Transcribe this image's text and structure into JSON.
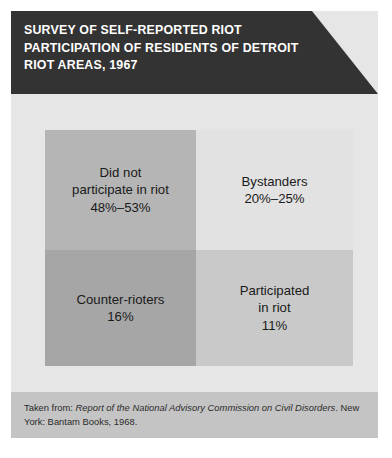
{
  "header": {
    "title_lines": [
      "SURVEY OF SELF-REPORTED RIOT",
      "PARTICIPATION OF RESIDENTS OF DETROIT",
      "RIOT AREAS, 1967"
    ],
    "background_color": "#333333",
    "text_color": "#ffffff"
  },
  "chart_data": {
    "type": "table",
    "title": "SURVEY OF SELF-REPORTED RIOT PARTICIPATION OF RESIDENTS OF DETROIT RIOT AREAS, 1967",
    "categories": [
      "Did not participate in riot",
      "Bystanders",
      "Counter-rioters",
      "Participated in riot"
    ],
    "values": [
      50.5,
      22.5,
      16,
      11
    ],
    "value_labels": [
      "48%–53%",
      "20%–25%",
      "16%",
      "11%"
    ],
    "xlabel": "",
    "ylabel": "",
    "grid": false,
    "legend": "none",
    "cells": [
      {
        "name": "did-not-participate",
        "label_lines": [
          "Did not",
          "participate in riot"
        ],
        "value_label": "48%–53%",
        "value_low": 48,
        "value_high": 53,
        "fill": "#b5b5b5"
      },
      {
        "name": "bystanders",
        "label_lines": [
          "Bystanders"
        ],
        "value_label": "20%–25%",
        "value_low": 20,
        "value_high": 25,
        "fill": "#e2e2e2"
      },
      {
        "name": "counter-rioters",
        "label_lines": [
          "Counter-rioters"
        ],
        "value_label": "16%",
        "value_low": 16,
        "value_high": 16,
        "fill": "#a6a6a6"
      },
      {
        "name": "participated-in-riot",
        "label_lines": [
          "Participated",
          "in riot"
        ],
        "value_label": "11%",
        "value_low": 11,
        "value_high": 11,
        "fill": "#c9c9c9"
      }
    ]
  },
  "diagram": {
    "nonparticipant": {
      "line1": "Did not",
      "line2": "participate in riot",
      "value": "48%–53%"
    },
    "bystanders": {
      "line1": "Bystanders",
      "value": "20%–25%"
    },
    "counter_rioters": {
      "line1": "Counter-rioters",
      "value": "16%"
    },
    "participated": {
      "line1": "Participated",
      "line2": "in riot",
      "value": "11%"
    }
  },
  "footer": {
    "prefix": "Taken from: ",
    "source_title": "Report of the National Advisory Commission on Civil Disorders",
    "suffix": ". New York: Bantam Books, 1968.",
    "background_color": "#c4c4c4"
  }
}
